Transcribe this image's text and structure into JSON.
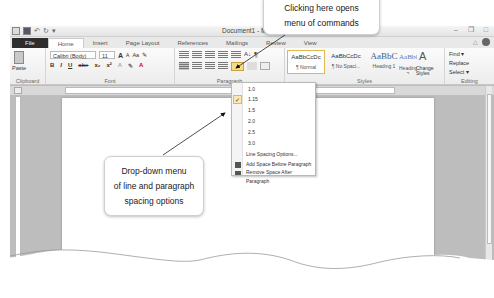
{
  "window": {
    "title": "Document1 - Microsoft Word",
    "title_visible": "Document1 - Micro",
    "quick_access": [
      "word-icon",
      "save-icon",
      "undo-icon",
      "redo-icon",
      "customize-icon"
    ],
    "controls": [
      "minimize",
      "restore",
      "close"
    ]
  },
  "tabs": [
    {
      "label": "File"
    },
    {
      "label": "Home"
    },
    {
      "label": "Insert"
    },
    {
      "label": "Page Layout"
    },
    {
      "label": "References"
    },
    {
      "label": "Mailings"
    },
    {
      "label": "Review"
    },
    {
      "label": "View"
    }
  ],
  "ribbon": {
    "clipboard": {
      "paste_label": "Paste",
      "group_label": "Clipboard"
    },
    "font": {
      "font_name": "Calibri (Body)",
      "font_size": "11",
      "grow": "A",
      "shrink": "A",
      "change_case": "Aa",
      "row2": [
        "B",
        "I",
        "U",
        "abe",
        "x₂",
        "x²"
      ],
      "group_label": "Font"
    },
    "paragraph": {
      "group_label": "Paragraph",
      "show_hide": "¶",
      "sort": "A↓"
    },
    "styles": {
      "items": [
        {
          "sample": "AaBbCcDc",
          "name": "¶ Normal"
        },
        {
          "sample": "AaBbCcDc",
          "name": "¶ No Spaci..."
        },
        {
          "sample": "AaBbC",
          "name": "Heading 1"
        },
        {
          "sample": "AaBbCc",
          "name": "Heading 2"
        }
      ],
      "change_styles": "Change Styles",
      "group_label": "Styles"
    },
    "editing": {
      "items": [
        "Find ▾",
        "Replace",
        "Select ▾"
      ],
      "group_label": "Editing"
    }
  },
  "spacing_menu": {
    "options": [
      "1.0",
      "1.15",
      "1.5",
      "2.0",
      "2.5",
      "3.0"
    ],
    "selected": "1.15",
    "check_mark": "✓",
    "more": "Line Spacing Options...",
    "add_before": "Add Space Before Paragraph",
    "remove_after": "Remove Space After Paragraph"
  },
  "callouts": {
    "top": [
      "Clicking here opens",
      "menu of commands"
    ],
    "middle": [
      "Drop-down menu",
      "of line and paragraph",
      "spacing options"
    ]
  },
  "colors": {
    "file_tab": "#2e2e2e",
    "highlight": "#f5dc8b",
    "highlight_border": "#e0b84e"
  }
}
